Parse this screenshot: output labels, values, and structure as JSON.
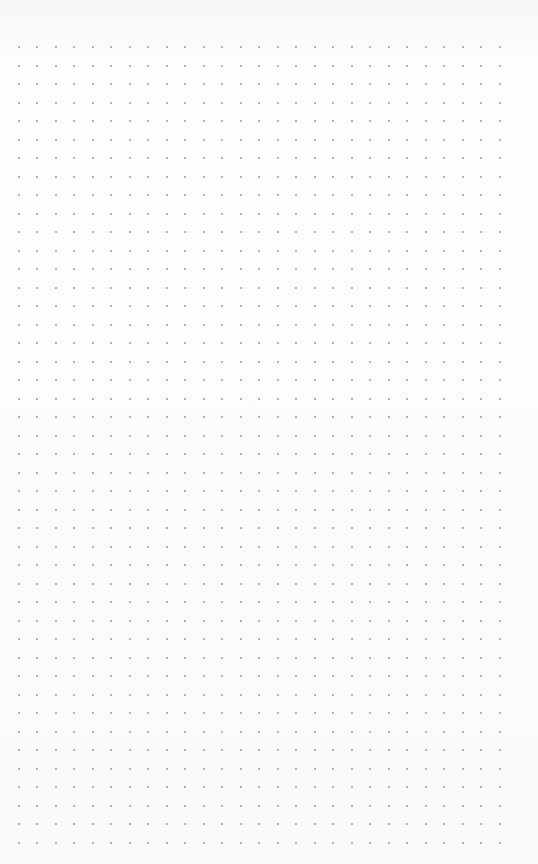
{
  "page": {
    "type": "dot-grid-paper",
    "background_color": "#fbfbfb",
    "dot_color": "#9a9a9a"
  },
  "grid": {
    "columns": 27,
    "rows": 44,
    "origin_x": 18.5,
    "origin_y": 47,
    "spacing": 18.5,
    "dot_size": 2
  }
}
